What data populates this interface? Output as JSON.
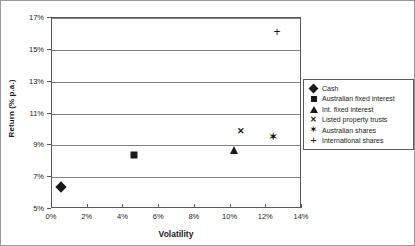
{
  "chart_data": {
    "type": "scatter",
    "title": "",
    "xlabel": "Volatility",
    "ylabel": "Return (% p.a.)",
    "xlim": [
      0,
      14
    ],
    "ylim": [
      5,
      17
    ],
    "xticks": [
      "0%",
      "2%",
      "4%",
      "6%",
      "8%",
      "10%",
      "12%",
      "14%"
    ],
    "xtick_values": [
      0,
      2,
      4,
      6,
      8,
      10,
      12,
      14
    ],
    "yticks": [
      "5%",
      "7%",
      "9%",
      "11%",
      "13%",
      "15%",
      "17%"
    ],
    "ytick_values": [
      5,
      7,
      9,
      11,
      13,
      15,
      17
    ],
    "grid": "horizontal",
    "legend_position": "right",
    "points": [
      {
        "name": "Cash",
        "marker": "diamond",
        "x": 0.5,
        "y": 6.4
      },
      {
        "name": "Australian fixed interest",
        "marker": "square",
        "x": 4.6,
        "y": 8.4
      },
      {
        "name": "Int. fixed interest",
        "marker": "triangle",
        "x": 10.2,
        "y": 8.7
      },
      {
        "name": "Listed property trusts",
        "marker": "cross",
        "x": 10.6,
        "y": 9.9
      },
      {
        "name": "Australian shares",
        "marker": "star",
        "x": 12.4,
        "y": 9.5
      },
      {
        "name": "International shares",
        "marker": "plus",
        "x": 12.6,
        "y": 16.1
      }
    ],
    "legend": [
      {
        "label": "Cash",
        "marker": "diamond"
      },
      {
        "label": "Australian fixed interest",
        "marker": "square"
      },
      {
        "label": "Int. fixed interest",
        "marker": "triangle"
      },
      {
        "label": "Listed property trusts",
        "marker": "cross"
      },
      {
        "label": "Australian shares",
        "marker": "star"
      },
      {
        "label": "International shares",
        "marker": "plus"
      }
    ],
    "marker_glyphs": {
      "cross": "✕",
      "star": "✶",
      "plus": "+"
    },
    "colors": {
      "marker": "#1a1a1a",
      "gridline": "#808080",
      "axis": "#595959",
      "background": "#ffffff",
      "border": "#9a9a9a"
    }
  }
}
